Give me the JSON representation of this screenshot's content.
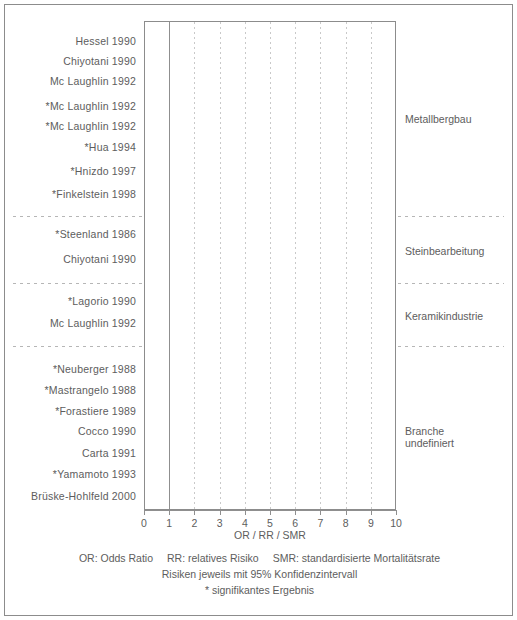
{
  "axis": {
    "title": "OR / RR / SMR",
    "ticks": [
      0,
      1,
      2,
      3,
      4,
      5,
      6,
      7,
      8,
      9,
      10
    ],
    "min": 0,
    "max": 10
  },
  "footer": {
    "line1_a": "OR: Odds Ratio",
    "line1_b": "RR: relatives Risiko",
    "line1_c": "SMR: standardisierte Mortalitätsrate",
    "line2": "Risiken jeweils mit 95% Konfidenzintervall",
    "line3": "* signifikantes Ergebnis"
  },
  "groups": [
    {
      "name": "Metallbergbau",
      "label_lines": [
        "Metallbergbau"
      ]
    },
    {
      "name": "Steinbearbeitung",
      "label_lines": [
        "Steinbearbeitung"
      ]
    },
    {
      "name": "Keramikindustrie",
      "label_lines": [
        "Keramikindustrie"
      ]
    },
    {
      "name": "Branche undefiniert",
      "label_lines": [
        "Branche",
        "undefiniert"
      ]
    }
  ],
  "chart_data": {
    "type": "forest",
    "title": "",
    "xlabel": "OR / RR / SMR",
    "ylabel": "",
    "xlim": [
      0,
      10
    ],
    "grid": "vertical dotted at integer ticks, solid reference line at 1",
    "reference_line": 1,
    "legend": "none",
    "annotations": [
      "* signifikantes Ergebnis",
      "Risiken jeweils mit 95% Konfidenzintervall"
    ],
    "groups": [
      "Metallbergbau",
      "Steinbearbeitung",
      "Keramikindustrie",
      "Branche undefiniert"
    ],
    "studies": [
      {
        "label": "Hessel 1990",
        "group": "Metallbergbau",
        "significant": false,
        "estimate": 1.1,
        "ci_low": 0.85,
        "ci_high": 1.8
      },
      {
        "label": "Chiyotani 1990",
        "group": "Metallbergbau",
        "significant": false,
        "estimate": 1.85,
        "ci_low": 0.7,
        "ci_high": 5.0
      },
      {
        "label": "Mc Laughlin 1992",
        "group": "Metallbergbau",
        "significant": false,
        "estimate": 0.85,
        "ci_low": 0.5,
        "ci_high": 1.35
      },
      {
        "label": "*Mc Laughlin 1992",
        "group": "Metallbergbau",
        "significant": true,
        "estimate": 3.15,
        "ci_low": 1.85,
        "ci_high": 5.6
      },
      {
        "label": "*Mc Laughlin 1992",
        "group": "Metallbergbau",
        "significant": true,
        "estimate": 2.05,
        "ci_low": 1.45,
        "ci_high": 2.8
      },
      {
        "label": "*Hua 1994",
        "group": "Metallbergbau",
        "significant": true,
        "estimate": 2.05,
        "ci_low": 1.3,
        "ci_high": 3.4
      },
      {
        "label": "*Hnizdo 1997",
        "group": "Metallbergbau",
        "significant": true,
        "estimate": 2.5,
        "ci_low": 1.2,
        "ci_high": 5.3
      },
      {
        "label": "*Finkelstein 1998",
        "group": "Metallbergbau",
        "significant": true,
        "estimate": 3.3,
        "ci_low": 1.4,
        "ci_high": 8.3
      },
      {
        "label": "*Steenland 1986",
        "group": "Steinbearbeitung",
        "significant": true,
        "estimate": 3.3,
        "ci_low": 1.7,
        "ci_high": 6.4
      },
      {
        "label": "Chiyotani 1990",
        "group": "Steinbearbeitung",
        "significant": false,
        "estimate": 1.4,
        "ci_low": 0.7,
        "ci_high": 2.9
      },
      {
        "label": "*Lagorio 1990",
        "group": "Keramikindustrie",
        "significant": true,
        "estimate": 3.95,
        "ci_low": 1.85,
        "ci_high": 8.4
      },
      {
        "label": "Mc Laughlin 1992",
        "group": "Keramikindustrie",
        "significant": false,
        "estimate": 0.55,
        "ci_low": 0.25,
        "ci_high": 0.95
      },
      {
        "label": "*Neuberger 1988",
        "group": "Branche undefiniert",
        "significant": true,
        "estimate": 1.45,
        "ci_low": 1.1,
        "ci_high": 1.85
      },
      {
        "label": "*Mastrangelo 1988",
        "group": "Branche undefiniert",
        "significant": true,
        "estimate": 1.95,
        "ci_low": 1.25,
        "ci_high": 3.1
      },
      {
        "label": "*Forastiere 1989",
        "group": "Branche undefiniert",
        "significant": true,
        "estimate": 1.55,
        "ci_low": 1.1,
        "ci_high": 2.0
      },
      {
        "label": "Cocco 1990",
        "group": "Branche undefiniert",
        "significant": false,
        "estimate": 2.45,
        "ci_low": 0.95,
        "ci_high": 6.3
      },
      {
        "label": "Carta 1991",
        "group": "Branche undefiniert",
        "significant": false,
        "estimate": 1.9,
        "ci_low": 0.45,
        "ci_high": 8.5
      },
      {
        "label": "*Yamamoto 1993",
        "group": "Branche undefiniert",
        "significant": true,
        "estimate": 3.9,
        "ci_low": 2.4,
        "ci_high": 5.5
      },
      {
        "label": "Brüske-Hohlfeld 2000",
        "group": "Branche undefiniert",
        "significant": false,
        "estimate": 1.55,
        "ci_low": 1.05,
        "ci_high": 2.35
      }
    ],
    "row_y": [
      36,
      56,
      76,
      101,
      121,
      142,
      166,
      189,
      229,
      254,
      296,
      318,
      364,
      385,
      406,
      426,
      448,
      469,
      491
    ],
    "separator_y": [
      211,
      278,
      341
    ],
    "group_label_y": [
      108,
      240,
      305,
      420
    ]
  }
}
